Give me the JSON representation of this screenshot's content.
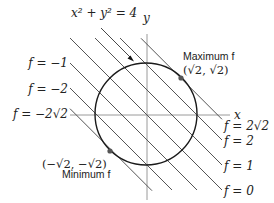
{
  "figure": {
    "title_equation": "x² + y² = 4",
    "axis_labels": {
      "x": "x",
      "y": "y"
    },
    "constraint": {
      "type": "circle",
      "equation": "x² + y² = 4",
      "center": [
        0,
        0
      ],
      "radius": 2
    },
    "level_lines": [
      {
        "label": "f = −2√2",
        "c": -2.828,
        "side": "left"
      },
      {
        "label": "f = −2",
        "c": -2,
        "side": "left"
      },
      {
        "label": "f = −1",
        "c": -1,
        "side": "left"
      },
      {
        "label": "f = 0",
        "c": 0,
        "side": "right"
      },
      {
        "label": "f = 1",
        "c": 1,
        "side": "right"
      },
      {
        "label": "f = 2",
        "c": 2,
        "side": "right"
      },
      {
        "label": "f = 2√2",
        "c": 2.828,
        "side": "right"
      }
    ],
    "maximum": {
      "title": "Maximum f",
      "point_label": "(√2, √2)",
      "point": [
        1.414,
        1.414
      ]
    },
    "minimum": {
      "title": "Minimum f",
      "point_label": "(−√2, −√2)",
      "point": [
        -1.414,
        -1.414
      ]
    },
    "colors": {
      "curve": "#1a1a1a",
      "lines": "#555555",
      "axes": "#9a9a9a",
      "points": "#555555"
    }
  }
}
